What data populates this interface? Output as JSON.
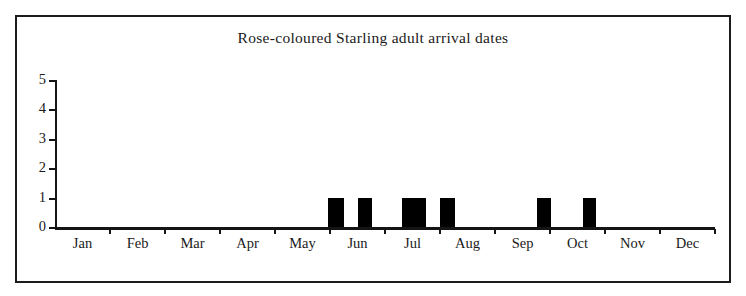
{
  "chart_data": {
    "type": "bar",
    "title": "Rose-coloured Starling adult arrival dates",
    "xlabel": "",
    "ylabel": "",
    "grid": false,
    "legend": false,
    "legend_position": "none",
    "bar_color": "#000000",
    "axis_color": "#141414",
    "background_color": "#ffffff",
    "categories": [
      "Jan",
      "Feb",
      "Mar",
      "Apr",
      "May",
      "Jun",
      "Jul",
      "Aug",
      "Sep",
      "Oct",
      "Nov",
      "Dec"
    ],
    "values": [
      0,
      0,
      0,
      0,
      0,
      2,
      2,
      0,
      1,
      1,
      0,
      0
    ],
    "ylim": [
      0,
      5
    ],
    "ytick_labels": [
      "0",
      "1",
      "2",
      "3",
      "4",
      "5"
    ],
    "ytick_values": [
      0,
      1,
      2,
      3,
      4,
      5
    ],
    "note": "Bars are plotted at sub-month (pentade/10-day) resolution; each individual bar has a height of 1 record.",
    "bars": [
      {
        "label": "late May / early Jun",
        "value": 1,
        "x_start_px": 273,
        "width_px": 16
      },
      {
        "label": "mid Jun",
        "value": 1,
        "x_start_px": 303,
        "width_px": 14
      },
      {
        "label": "early Jul",
        "value": 1,
        "x_start_px": 347,
        "width_px": 24
      },
      {
        "label": "late Jul",
        "value": 1,
        "x_start_px": 385,
        "width_px": 15
      },
      {
        "label": "mid Sep",
        "value": 1,
        "x_start_px": 482,
        "width_px": 14
      },
      {
        "label": "early Oct",
        "value": 1,
        "x_start_px": 528,
        "width_px": 13
      }
    ]
  },
  "frame": {
    "border_color": "#1c1c1c"
  }
}
